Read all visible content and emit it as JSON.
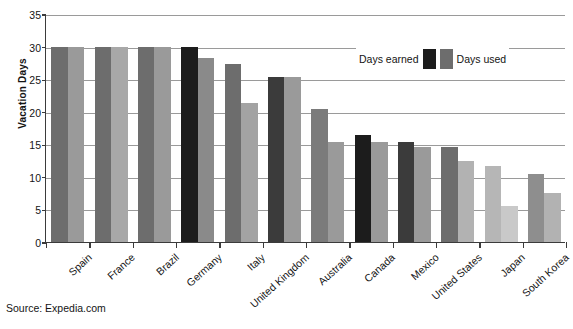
{
  "chart_data": {
    "type": "bar",
    "title": "",
    "xlabel": "",
    "ylabel": "Vacation Days",
    "ylim": [
      0,
      35
    ],
    "yticks": [
      0,
      5,
      10,
      15,
      20,
      25,
      30,
      35
    ],
    "grid": true,
    "legend_position": "inside-top-right",
    "categories": [
      "Spain",
      "France",
      "Brazil",
      "Germany",
      "Italy",
      "United Kingdom",
      "Australia",
      "Canada",
      "Mexico",
      "United States",
      "Japan",
      "South Korea"
    ],
    "series": [
      {
        "name": "Days earned",
        "values": [
          30,
          30,
          30,
          30,
          27.3,
          25.3,
          20.4,
          16.5,
          15.3,
          14.6,
          11.7,
          10.5
        ]
      },
      {
        "name": "Days used",
        "values": [
          30,
          30,
          30,
          28.2,
          21.3,
          25.3,
          15.3,
          15.3,
          14.6,
          12.5,
          5.5,
          7.6
        ]
      }
    ],
    "bar_colors_earned": [
      "#6d6d6d",
      "#6d6d6d",
      "#6d6d6d",
      "#1c1c1c",
      "#6d6d6d",
      "#3b3b3b",
      "#7b7b7b",
      "#1c1c1c",
      "#3b3b3b",
      "#6d6d6d",
      "#b6b6b6",
      "#8e8e8e"
    ],
    "bar_colors_used": [
      "#9a9a9a",
      "#a8a8a8",
      "#9a9a9a",
      "#8a8a8a",
      "#a3a3a3",
      "#9a9a9a",
      "#9a9a9a",
      "#9a9a9a",
      "#9a9a9a",
      "#b2b2b2",
      "#c9c9c9",
      "#b2b2b2"
    ],
    "annotations": []
  },
  "legend": {
    "earned_label": "Days earned",
    "used_label": "Days used",
    "earned_color": "#1c1c1c",
    "used_color": "#6d6d6d"
  },
  "source": {
    "text": "Source:  Expedia.com"
  }
}
